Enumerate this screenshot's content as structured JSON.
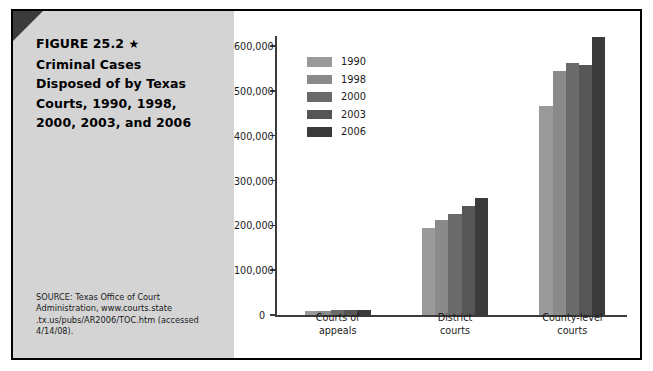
{
  "figure": {
    "label": "FIGURE 25.2",
    "star": "★",
    "title_lines": [
      "Criminal Cases",
      "Disposed of by Texas",
      "Courts, 1990, 1998,",
      "2000, 2003, and 2006"
    ],
    "source_lines": [
      "SOURCE: Texas Office of Court",
      "Administration, www.courts.state",
      ".tx.us/pubs/AR2006/TOC.htm (accessed",
      "4/14/08)."
    ]
  },
  "chart_data": {
    "type": "bar",
    "title": "Criminal Cases Disposed of by Texas Courts, 1990, 1998, 2000, 2003, and 2006",
    "xlabel": "",
    "ylabel": "",
    "categories": [
      "Courts of appeals",
      "District courts",
      "County-level courts"
    ],
    "category_label_lines": [
      [
        "Courts of",
        "appeals"
      ],
      [
        "District",
        "courts"
      ],
      [
        "County-level",
        "courts"
      ]
    ],
    "series": [
      {
        "name": "1990",
        "color": "#9a9a9a",
        "values": [
          10000,
          193000,
          467000
        ]
      },
      {
        "name": "1998",
        "color": "#8a8a8a",
        "values": [
          10000,
          212000,
          545000
        ]
      },
      {
        "name": "2000",
        "color": "#6a6a6a",
        "values": [
          11000,
          226000,
          562000
        ]
      },
      {
        "name": "2003",
        "color": "#565656",
        "values": [
          11000,
          243000,
          558000
        ]
      },
      {
        "name": "2006",
        "color": "#3b3b3b",
        "values": [
          11000,
          260000,
          620000
        ]
      }
    ],
    "ylim": [
      0,
      600000
    ],
    "yticks": [
      0,
      100000,
      200000,
      300000,
      400000,
      500000,
      600000
    ],
    "ytick_labels": [
      "0",
      "100,000",
      "200,000",
      "300,000",
      "400,000",
      "500,000",
      "600,000"
    ],
    "grid": false,
    "legend_position": "inside-upper-left"
  },
  "colors": {
    "frame": "#000000",
    "caption_background": "#d4d4d4",
    "corner": "#3b3b3b",
    "axis": "#3b3b3b",
    "text": "#1a1a1a"
  }
}
